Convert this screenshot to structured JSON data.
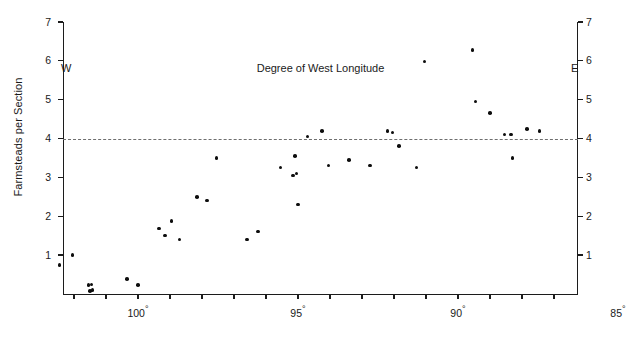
{
  "chart_data": {
    "type": "scatter",
    "title": "",
    "xlabel": "Degree of West Longitude",
    "ylabel": "Farmsteads per Section",
    "xlim": [
      102.8,
      85.0
    ],
    "ylim": [
      0.0,
      7.0
    ],
    "x_axis_inverted": true,
    "grid": false,
    "legend": null,
    "x_tick_labels": [
      "100",
      "95",
      "90",
      "85"
    ],
    "x_tick_values": [
      100,
      95,
      90,
      85
    ],
    "x_minor_tick_values": [
      102,
      101,
      99,
      98,
      97,
      96,
      94,
      93,
      92,
      91,
      89,
      88,
      87,
      86
    ],
    "y_tick_labels": [
      "1",
      "2",
      "3",
      "4",
      "5",
      "6",
      "7"
    ],
    "y_tick_values": [
      1,
      2,
      3,
      4,
      5,
      6,
      7
    ],
    "y_axis_duplicated_right": true,
    "annotations": [
      {
        "name": "west-end-label",
        "text": "W",
        "position": "below-axis-left"
      },
      {
        "name": "east-end-label",
        "text": "E",
        "position": "below-axis-right"
      }
    ],
    "reference_line": {
      "orientation": "horizontal",
      "y": 4.0,
      "style": "dashed",
      "color": "#6e6e6e"
    },
    "marker": {
      "shape": "circle",
      "color": "#0d0d0d",
      "size_px": 3.6
    },
    "points": [
      {
        "x": 102.45,
        "y": 0.75
      },
      {
        "x": 102.05,
        "y": 1.0
      },
      {
        "x": 101.55,
        "y": 0.22
      },
      {
        "x": 101.45,
        "y": 0.24
      },
      {
        "x": 101.42,
        "y": 0.1
      },
      {
        "x": 101.5,
        "y": 0.08
      },
      {
        "x": 100.35,
        "y": 0.38
      },
      {
        "x": 100.0,
        "y": 0.22
      },
      {
        "x": 99.35,
        "y": 1.68
      },
      {
        "x": 99.15,
        "y": 1.5
      },
      {
        "x": 98.95,
        "y": 1.88
      },
      {
        "x": 98.7,
        "y": 1.4
      },
      {
        "x": 98.15,
        "y": 2.5
      },
      {
        "x": 97.85,
        "y": 2.4
      },
      {
        "x": 97.55,
        "y": 3.5
      },
      {
        "x": 96.6,
        "y": 1.4
      },
      {
        "x": 96.25,
        "y": 1.6
      },
      {
        "x": 95.55,
        "y": 3.25
      },
      {
        "x": 95.1,
        "y": 3.55
      },
      {
        "x": 95.05,
        "y": 3.1
      },
      {
        "x": 95.15,
        "y": 3.05
      },
      {
        "x": 95.0,
        "y": 2.3
      },
      {
        "x": 94.7,
        "y": 4.05
      },
      {
        "x": 94.25,
        "y": 4.2
      },
      {
        "x": 94.05,
        "y": 3.3
      },
      {
        "x": 93.4,
        "y": 3.45
      },
      {
        "x": 92.75,
        "y": 3.3
      },
      {
        "x": 92.2,
        "y": 4.2
      },
      {
        "x": 92.05,
        "y": 4.15
      },
      {
        "x": 91.85,
        "y": 3.8
      },
      {
        "x": 91.3,
        "y": 3.25
      },
      {
        "x": 91.05,
        "y": 5.98
      },
      {
        "x": 89.55,
        "y": 6.28
      },
      {
        "x": 89.45,
        "y": 4.95
      },
      {
        "x": 89.0,
        "y": 4.65
      },
      {
        "x": 88.55,
        "y": 4.1
      },
      {
        "x": 88.35,
        "y": 4.1
      },
      {
        "x": 88.3,
        "y": 3.5
      },
      {
        "x": 87.85,
        "y": 4.25
      },
      {
        "x": 87.45,
        "y": 4.2
      }
    ]
  },
  "colors": {
    "axis": "#1c1c1c",
    "marker": "#0d0d0d",
    "reference_line": "#6e6e6e",
    "background": "#ffffff",
    "text": "#1a1a1a"
  }
}
